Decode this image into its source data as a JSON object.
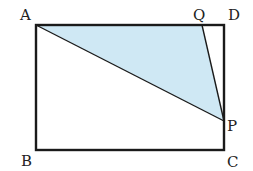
{
  "diagram": {
    "type": "geometry",
    "colors": {
      "stroke": "#1a1a1a",
      "shade": "#cfe8f4",
      "background": "#ffffff"
    },
    "points": {
      "A": {
        "label": "A",
        "x": 36,
        "y": 25
      },
      "B": {
        "label": "B",
        "x": 36,
        "y": 150
      },
      "C": {
        "label": "C",
        "x": 224,
        "y": 150
      },
      "D": {
        "label": "D",
        "x": 224,
        "y": 25
      },
      "Q": {
        "label": "Q",
        "x": 202,
        "y": 25
      },
      "P": {
        "label": "P",
        "x": 224,
        "y": 121
      }
    },
    "rectangle": [
      "A",
      "B",
      "C",
      "D"
    ],
    "shaded_triangle": [
      "A",
      "P",
      "Q"
    ]
  }
}
